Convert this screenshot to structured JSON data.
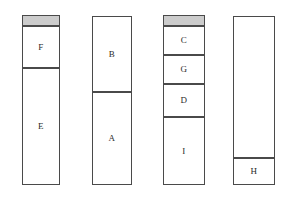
{
  "diagram": {
    "type": "stacked-bar-columns",
    "background_color": "#ffffff",
    "border_color": "#4a4a4a",
    "fill_color": "#ffffff",
    "cap_fill_color": "#cccccc",
    "label_color": "#2b2b2b",
    "canvas": {
      "width": 284,
      "height": 198
    },
    "columns": [
      {
        "id": "column-1",
        "x": 22,
        "width": 38,
        "segments": [
          {
            "label": "",
            "fill": "cap",
            "top": 15,
            "height": 11
          },
          {
            "label": "F",
            "fill": "white",
            "top": 26,
            "height": 42
          },
          {
            "label": "E",
            "fill": "white",
            "top": 68,
            "height": 117
          }
        ]
      },
      {
        "id": "column-2",
        "x": 92,
        "width": 40,
        "segments": [
          {
            "label": "B",
            "fill": "white",
            "top": 16,
            "height": 76
          },
          {
            "label": "A",
            "fill": "white",
            "top": 92,
            "height": 93
          }
        ]
      },
      {
        "id": "column-3",
        "x": 163,
        "width": 42,
        "segments": [
          {
            "label": "",
            "fill": "cap",
            "top": 15,
            "height": 11
          },
          {
            "label": "C",
            "fill": "white",
            "top": 26,
            "height": 29
          },
          {
            "label": "G",
            "fill": "white",
            "top": 55,
            "height": 29
          },
          {
            "label": "D",
            "fill": "white",
            "top": 84,
            "height": 33
          },
          {
            "label": "I",
            "fill": "white",
            "top": 117,
            "height": 68
          }
        ]
      },
      {
        "id": "column-4",
        "x": 233,
        "width": 42,
        "segments": [
          {
            "label": "",
            "fill": "white",
            "top": 16,
            "height": 142
          },
          {
            "label": "H",
            "fill": "white",
            "top": 158,
            "height": 27
          }
        ]
      }
    ]
  }
}
